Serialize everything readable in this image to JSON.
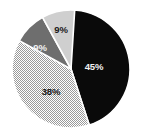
{
  "chart_data": {
    "type": "pie",
    "title": "",
    "subtitle": "",
    "xlabel": "",
    "ylabel": "",
    "legend": "none",
    "grid": false,
    "start_angle_deg": 0,
    "direction": "clockwise",
    "categories": [
      "Series 1",
      "Series 2",
      "Series 3",
      "Series 4"
    ],
    "values": [
      45,
      38,
      9,
      9
    ],
    "labels": [
      "45%",
      "38%",
      "9%",
      "9%"
    ],
    "slices": [
      {
        "label": "45%",
        "value": 45,
        "sweep_deg": 162,
        "start_deg": 0,
        "fill": "#0a0a0a",
        "fill_style": "solid",
        "label_color": "#f2f2f2",
        "label_x": 94,
        "label_y": 67
      },
      {
        "label": "38%",
        "value": 38,
        "sweep_deg": 136.8,
        "start_deg": 162,
        "fill": "#d9d9d9",
        "fill_style": "checker",
        "label_color": "#1a1a1a",
        "label_x": 51,
        "label_y": 92
      },
      {
        "label": "9%",
        "value": 9,
        "sweep_deg": 32.4,
        "start_deg": 298.8,
        "fill": "#6e6e6e",
        "fill_style": "solid",
        "label_color": "#f2f2f2",
        "label_x": 40,
        "label_y": 48
      },
      {
        "label": "9%",
        "value": 9,
        "sweep_deg": 32.4,
        "start_deg": 331.2,
        "fill": "#cfcfcf",
        "fill_style": "solid",
        "label_color": "#1a1a1a",
        "label_x": 61,
        "label_y": 30
      }
    ],
    "geometry": {
      "center_x": 71,
      "center_y": 69,
      "radius": 59
    },
    "colors": {
      "background": "#ffffff",
      "separator": "#ffffff",
      "black_slice": "#0a0a0a",
      "dark_gray_slice": "#6e6e6e",
      "light_gray_slice": "#cfcfcf",
      "pattern_slice": "#d9d9d9"
    }
  }
}
